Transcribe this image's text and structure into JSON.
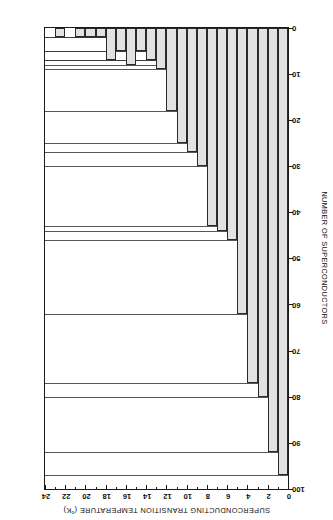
{
  "chart_data": {
    "type": "bar",
    "title": "",
    "xlabel": "SUPERCONDUCTING TRANSITION TEMPERATURE (°K)",
    "ylabel": "NUMBER OF SUPERCONDUCTORS",
    "xlim": [
      0,
      24
    ],
    "ylim": [
      0,
      100
    ],
    "xticks": [
      0,
      2,
      4,
      6,
      8,
      10,
      12,
      14,
      16,
      18,
      20,
      22,
      24
    ],
    "xticklabels": [
      "0",
      "2",
      "4",
      "6",
      "8",
      "10",
      "12",
      "14",
      "16",
      "18",
      "20",
      "22",
      "24"
    ],
    "yticks": [
      0,
      10,
      20,
      30,
      40,
      50,
      60,
      70,
      80,
      90,
      100
    ],
    "yticklabels": [
      "0",
      "10",
      "20",
      "30",
      "40",
      "50",
      "60",
      "70",
      "80",
      "90",
      "100"
    ],
    "grid": false,
    "legend": null,
    "bin_width": 1,
    "orientation": "rotated-180",
    "bar_fill": "#e2e2e2",
    "bar_edge": "#2a2a2a",
    "categories": [
      "0-1",
      "1-2",
      "2-3",
      "3-4",
      "4-5",
      "5-6",
      "6-7",
      "7-8",
      "8-9",
      "9-10",
      "10-11",
      "11-12",
      "12-13",
      "13-14",
      "14-15",
      "15-16",
      "16-17",
      "17-18",
      "18-19",
      "19-20",
      "20-21",
      "21-22",
      "22-23",
      "23-24"
    ],
    "bin_starts": [
      0,
      1,
      2,
      3,
      4,
      5,
      6,
      7,
      8,
      9,
      10,
      11,
      12,
      13,
      14,
      15,
      16,
      17,
      18,
      19,
      20,
      21,
      22,
      23
    ],
    "values": [
      97,
      92,
      80,
      77,
      62,
      46,
      44,
      43,
      30,
      27,
      25,
      18,
      9,
      7,
      5,
      8,
      5,
      7,
      2,
      2,
      2,
      0,
      2,
      0
    ]
  },
  "axes": {
    "x_title": "SUPERCONDUCTING TRANSITION TEMPERATURE (",
    "x_title_sup": "o",
    "x_title_tail": "K)",
    "y_title": "NUMBER OF SUPERCONDUCTORS"
  }
}
